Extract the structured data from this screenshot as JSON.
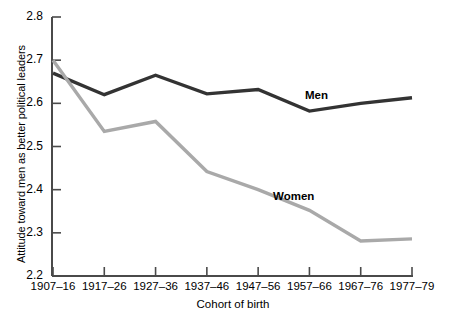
{
  "chart_data": {
    "type": "line",
    "title": "",
    "xlabel": "Cohort of birth",
    "ylabel": "Attitude toward men as better political leaders",
    "categories": [
      "1907–16",
      "1917–26",
      "1927–36",
      "1937–46",
      "1947–56",
      "1957–66",
      "1967–76",
      "1977–79"
    ],
    "ylim": [
      2.2,
      2.8
    ],
    "yticks": [
      "2.2",
      "2.3",
      "2.4",
      "2.5",
      "2.6",
      "2.7",
      "2.8"
    ],
    "ytick_values": [
      2.2,
      2.3,
      2.4,
      2.5,
      2.6,
      2.7,
      2.8
    ],
    "grid": false,
    "legend_position": "inline-annotations",
    "series": [
      {
        "name": "Men",
        "color": "#333333",
        "values": [
          2.67,
          2.62,
          2.665,
          2.622,
          2.632,
          2.582,
          2.6,
          2.613
        ]
      },
      {
        "name": "Women",
        "color": "#a9a9a9",
        "values": [
          2.7,
          2.535,
          2.558,
          2.442,
          2.4,
          2.352,
          2.281,
          2.286
        ]
      }
    ],
    "annotations": [
      {
        "text": "Men",
        "series": "Men",
        "x_px": 305,
        "y_px": 89
      },
      {
        "text": "Women",
        "series": "Women",
        "x_px": 273,
        "y_px": 190
      }
    ]
  },
  "axis": {
    "y_min_label": "2.2",
    "y_max_label": "2.8"
  }
}
